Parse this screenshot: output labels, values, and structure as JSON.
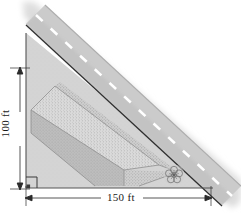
{
  "figure": {
    "name": "roadside-excavation-diagram",
    "type": "technical-illustration",
    "dimensions": {
      "height_label": "100 ft",
      "width_label": "150 ft"
    },
    "elements": {
      "road_label": "road",
      "centerline_label": "dashed-center-line",
      "prism_label": "excavation-prism",
      "bush_label": "bush",
      "right_angle_label": "right-angle-marker"
    },
    "colors": {
      "terrain": "#d2d2d2",
      "terrain_light": "#dcdcdc",
      "road": "#c4c4c4",
      "road_dark": "#b9b9b9",
      "prism_face_left": "#b5b5b5",
      "prism_face_top": "#d7d7d7",
      "prism_face_front": "#cccccc",
      "line": "#2b2b2b",
      "dash": "#ffffff",
      "text": "#1a1a1a"
    }
  }
}
